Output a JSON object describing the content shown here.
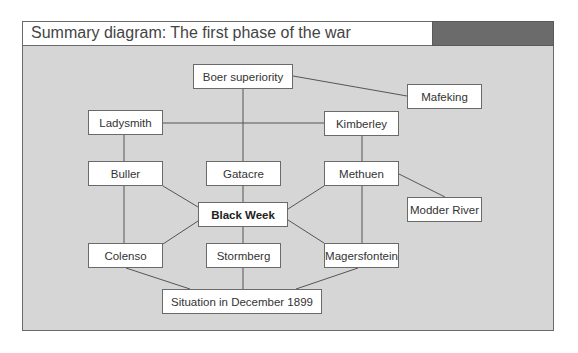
{
  "header": {
    "title": "Summary diagram: The first phase of the war",
    "accent_color": "#6b6b6b"
  },
  "colors": {
    "background": "#d6d6d6",
    "node_fill": "#ffffff",
    "line": "#555555"
  },
  "nodes": [
    {
      "id": "boer",
      "label": "Boer superiority",
      "x": 193,
      "y": 64,
      "w": 100,
      "h": 25
    },
    {
      "id": "mafeking",
      "label": "Mafeking",
      "x": 407,
      "y": 84,
      "w": 75,
      "h": 25
    },
    {
      "id": "ladysmith",
      "label": "Ladysmith",
      "x": 88,
      "y": 110,
      "w": 75,
      "h": 25
    },
    {
      "id": "kimberley",
      "label": "Kimberley",
      "x": 324,
      "y": 111,
      "w": 75,
      "h": 25
    },
    {
      "id": "buller",
      "label": "Buller",
      "x": 88,
      "y": 161,
      "w": 75,
      "h": 25
    },
    {
      "id": "gatacre",
      "label": "Gatacre",
      "x": 206,
      "y": 161,
      "w": 75,
      "h": 25
    },
    {
      "id": "methuen",
      "label": "Methuen",
      "x": 324,
      "y": 161,
      "w": 75,
      "h": 25
    },
    {
      "id": "blackweek",
      "label": "Black Week",
      "x": 198,
      "y": 202,
      "w": 90,
      "h": 25,
      "bold": true
    },
    {
      "id": "modder",
      "label": "Modder River",
      "x": 407,
      "y": 197,
      "w": 75,
      "h": 25
    },
    {
      "id": "colenso",
      "label": "Colenso",
      "x": 88,
      "y": 243,
      "w": 75,
      "h": 25
    },
    {
      "id": "stormberg",
      "label": "Stormberg",
      "x": 206,
      "y": 243,
      "w": 75,
      "h": 25
    },
    {
      "id": "magersfontein",
      "label": "Magersfontein",
      "x": 324,
      "y": 243,
      "w": 75,
      "h": 25
    },
    {
      "id": "situation",
      "label": "Situation in December 1899",
      "x": 162,
      "y": 289,
      "w": 160,
      "h": 25
    }
  ],
  "edges": [
    [
      "boer",
      "mafeking"
    ],
    [
      "boer",
      "gatacre"
    ],
    [
      "ladysmith",
      "kimberley"
    ],
    [
      "ladysmith",
      "buller"
    ],
    [
      "kimberley",
      "methuen"
    ],
    [
      "buller",
      "colenso"
    ],
    [
      "buller",
      "blackweek"
    ],
    [
      "gatacre",
      "blackweek"
    ],
    [
      "methuen",
      "blackweek"
    ],
    [
      "methuen",
      "magersfontein"
    ],
    [
      "methuen",
      "modder"
    ],
    [
      "blackweek",
      "colenso"
    ],
    [
      "blackweek",
      "stormberg"
    ],
    [
      "blackweek",
      "magersfontein"
    ],
    [
      "colenso",
      "situation"
    ],
    [
      "stormberg",
      "situation"
    ],
    [
      "magersfontein",
      "situation"
    ]
  ]
}
